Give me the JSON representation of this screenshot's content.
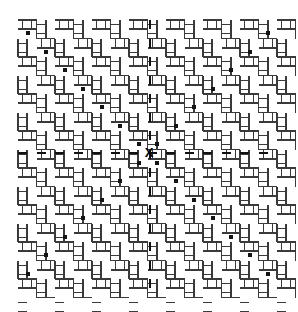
{
  "figure": {
    "canvas": {
      "width": 298,
      "height": 312,
      "background": "#ffffff"
    },
    "plot_area": {
      "x": 18,
      "y": 20,
      "width": 267,
      "height": 270
    },
    "marker_label": "X"
  },
  "chart_data": {
    "type": "heatmap",
    "subtitle": "",
    "xlabel": "",
    "ylabel": "",
    "grid": true,
    "legend_position": "none",
    "axis_ranges": {
      "x": [
        18,
        285
      ],
      "y": [
        20,
        290
      ]
    },
    "lattice": {
      "origin_x": 18,
      "origin_y": 20,
      "period": 18.5,
      "sub_offset": 9.25,
      "columns": 15,
      "rows": 15,
      "line_width_thin": 1,
      "line_width_thick": 2,
      "stroke_color": "#3a3a3a",
      "stroke_color_dark": "#1a1a1a",
      "segment_length": 18.5
    },
    "dot_markers": {
      "size": 4,
      "color": "#141414",
      "comment": "small filled squares placed along the main diagonal of the lattice, one per period",
      "points": [
        {
          "x": 28,
          "y": 33
        },
        {
          "x": 46,
          "y": 52
        },
        {
          "x": 65,
          "y": 70
        },
        {
          "x": 83,
          "y": 89
        },
        {
          "x": 102,
          "y": 107
        },
        {
          "x": 120,
          "y": 126
        },
        {
          "x": 139,
          "y": 144
        },
        {
          "x": 139,
          "y": 163
        },
        {
          "x": 157,
          "y": 144
        },
        {
          "x": 157,
          "y": 163
        },
        {
          "x": 176,
          "y": 126
        },
        {
          "x": 176,
          "y": 181
        },
        {
          "x": 194,
          "y": 107
        },
        {
          "x": 194,
          "y": 200
        },
        {
          "x": 213,
          "y": 89
        },
        {
          "x": 213,
          "y": 218
        },
        {
          "x": 231,
          "y": 70
        },
        {
          "x": 231,
          "y": 237
        },
        {
          "x": 250,
          "y": 52
        },
        {
          "x": 250,
          "y": 255
        },
        {
          "x": 268,
          "y": 33
        },
        {
          "x": 268,
          "y": 274
        },
        {
          "x": 46,
          "y": 255
        },
        {
          "x": 65,
          "y": 237
        },
        {
          "x": 83,
          "y": 218
        },
        {
          "x": 102,
          "y": 200
        },
        {
          "x": 120,
          "y": 181
        },
        {
          "x": 28,
          "y": 274
        }
      ]
    },
    "emphasis_column": {
      "x": 150,
      "y_start": 20,
      "y_end": 290,
      "color": "#111111",
      "tick_width": 2,
      "tick_height": 9,
      "period": 18.5
    },
    "emphasis_row": {
      "y": 153,
      "x_start": 18,
      "x_end": 285,
      "color": "#111111",
      "tick_height": 2,
      "tick_width": 9,
      "period": 18.5
    },
    "x_marker": {
      "label": "X",
      "cx": 149,
      "cy": 153,
      "font_size": 13,
      "color": "#000000"
    }
  }
}
